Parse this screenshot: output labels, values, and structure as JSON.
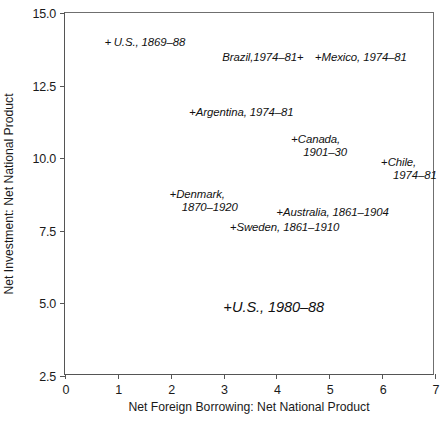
{
  "chart_data": {
    "type": "scatter",
    "title": "",
    "xlabel": "Net Foreign Borrowing: Net National Product",
    "ylabel": "Net Investment: Net National Product",
    "xlim": [
      0,
      7
    ],
    "ylim": [
      2.5,
      15.0
    ],
    "xticks": [
      "0",
      "1",
      "2",
      "3",
      "4",
      "5",
      "6",
      "7"
    ],
    "xtick_values": [
      0,
      1,
      2,
      3,
      4,
      5,
      6,
      7
    ],
    "yticks": [
      "15.0",
      "12.5",
      "10.0",
      "7.5",
      "5.0",
      "2.5"
    ],
    "ytick_values": [
      15.0,
      12.5,
      10.0,
      7.5,
      5.0,
      2.5
    ],
    "grid": false,
    "legend": "none",
    "marker": "+",
    "points": [
      {
        "name": "us-1869-88",
        "label": "U.S., 1869–88",
        "label_line2": "",
        "x": 0.75,
        "y": 14.0,
        "marker_side": "left",
        "spaced_marker": true,
        "size": "normal"
      },
      {
        "name": "brazil-1974-81",
        "label": "Brazil,1974–81",
        "label_line2": "",
        "x": 4.56,
        "y": 13.5,
        "marker_side": "right",
        "spaced_marker": true,
        "size": "normal"
      },
      {
        "name": "mexico-1974-81",
        "label": "Mexico, 1974–81",
        "label_line2": "",
        "x": 4.73,
        "y": 13.5,
        "marker_side": "left",
        "spaced_marker": false,
        "size": "normal"
      },
      {
        "name": "argentina-1974-81",
        "label": "Argentina, 1974–81",
        "label_line2": "",
        "x": 2.35,
        "y": 11.6,
        "marker_side": "left",
        "spaced_marker": false,
        "size": "normal"
      },
      {
        "name": "canada-1901-30",
        "label": "Canada,",
        "label_line2": "1901–30",
        "x": 4.28,
        "y": 10.42,
        "marker_side": "left",
        "spaced_marker": false,
        "size": "normal"
      },
      {
        "name": "chile-1974-81",
        "label": "Chile,",
        "label_line2": "1974–81",
        "x": 5.98,
        "y": 9.62,
        "marker_side": "left",
        "spaced_marker": false,
        "size": "normal"
      },
      {
        "name": "denmark-1870-1920",
        "label": "Denmark,",
        "label_line2": "1870–1920",
        "x": 1.98,
        "y": 8.52,
        "marker_side": "left",
        "spaced_marker": false,
        "size": "normal"
      },
      {
        "name": "australia-1861-1904",
        "label": "Australia, 1861–1904",
        "label_line2": "",
        "x": 4.0,
        "y": 8.16,
        "marker_side": "left",
        "spaced_marker": false,
        "size": "normal"
      },
      {
        "name": "sweden-1861-1910",
        "label": "Sweden, 1861–1910",
        "label_line2": "",
        "x": 3.12,
        "y": 7.62,
        "marker_side": "left",
        "spaced_marker": false,
        "size": "normal"
      },
      {
        "name": "us-1980-88",
        "label": "U.S., 1980–88",
        "label_line2": "",
        "x": 3.0,
        "y": 4.86,
        "marker_side": "left",
        "spaced_marker": false,
        "size": "big"
      }
    ]
  }
}
